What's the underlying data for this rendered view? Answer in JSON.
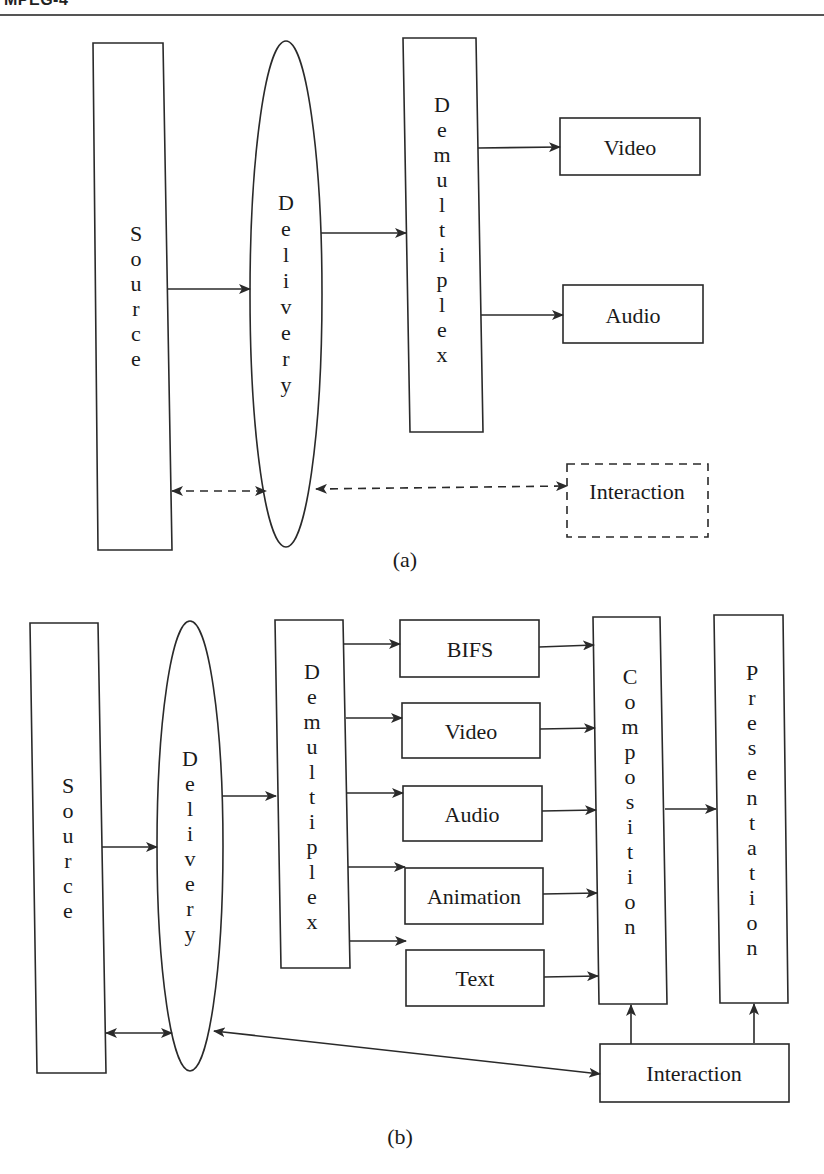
{
  "header": {
    "title": "MPEG-4"
  },
  "diagram_a": {
    "caption": "(a)",
    "source": "Source",
    "delivery": "Delivery",
    "demultiplex": "Demultiplex",
    "outputs": [
      "Video",
      "Audio"
    ],
    "interaction": "Interaction",
    "interaction_style": "dashed"
  },
  "diagram_b": {
    "caption": "(b)",
    "source": "Source",
    "delivery": "Delivery",
    "demultiplex": "Demultiplex",
    "streams": [
      "BIFS",
      "Video",
      "Audio",
      "Animation",
      "Text"
    ],
    "composition": "Composition",
    "presentation": "Presentation",
    "interaction": "Interaction",
    "interaction_style": "solid"
  },
  "colors": {
    "stroke": "#2a2a2a",
    "background": "#ffffff",
    "text": "#1a1a1a"
  }
}
